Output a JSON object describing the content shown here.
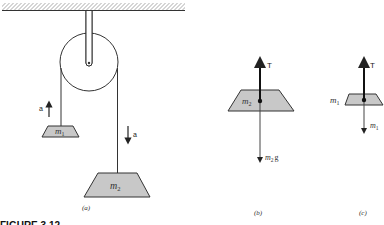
{
  "figure": {
    "caption": "FIGURE 3.12",
    "colors": {
      "block_fill": "#c8c8c8",
      "stroke": "#333333",
      "hatch": "#555555",
      "background": "#ffffff"
    },
    "panels": [
      {
        "id": "a",
        "label": "(a)",
        "description": "Atwood machine: pulley hanging from ceiling with two masses",
        "elements": {
          "ceiling": "hatched ceiling",
          "pulley": "pulley wheel on support rod",
          "left_mass": "m",
          "left_mass_sub": "1",
          "right_mass": "m",
          "right_mass_sub": "2",
          "left_accel_label": "a",
          "left_accel_dir": "up",
          "right_accel_label": "a",
          "right_accel_dir": "down"
        }
      },
      {
        "id": "b",
        "label": "(b)",
        "description": "Free-body diagram of m2",
        "elements": {
          "mass": "m",
          "mass_sub": "2",
          "up_force": "T",
          "down_force": "m",
          "down_force_sub": "2",
          "down_force_suffix": "g"
        }
      },
      {
        "id": "c",
        "label": "(c)",
        "description": "Free-body diagram of m1",
        "elements": {
          "mass": "m",
          "mass_sub": "1",
          "up_force": "T",
          "down_force": "m",
          "down_force_sub": "1"
        }
      }
    ]
  }
}
